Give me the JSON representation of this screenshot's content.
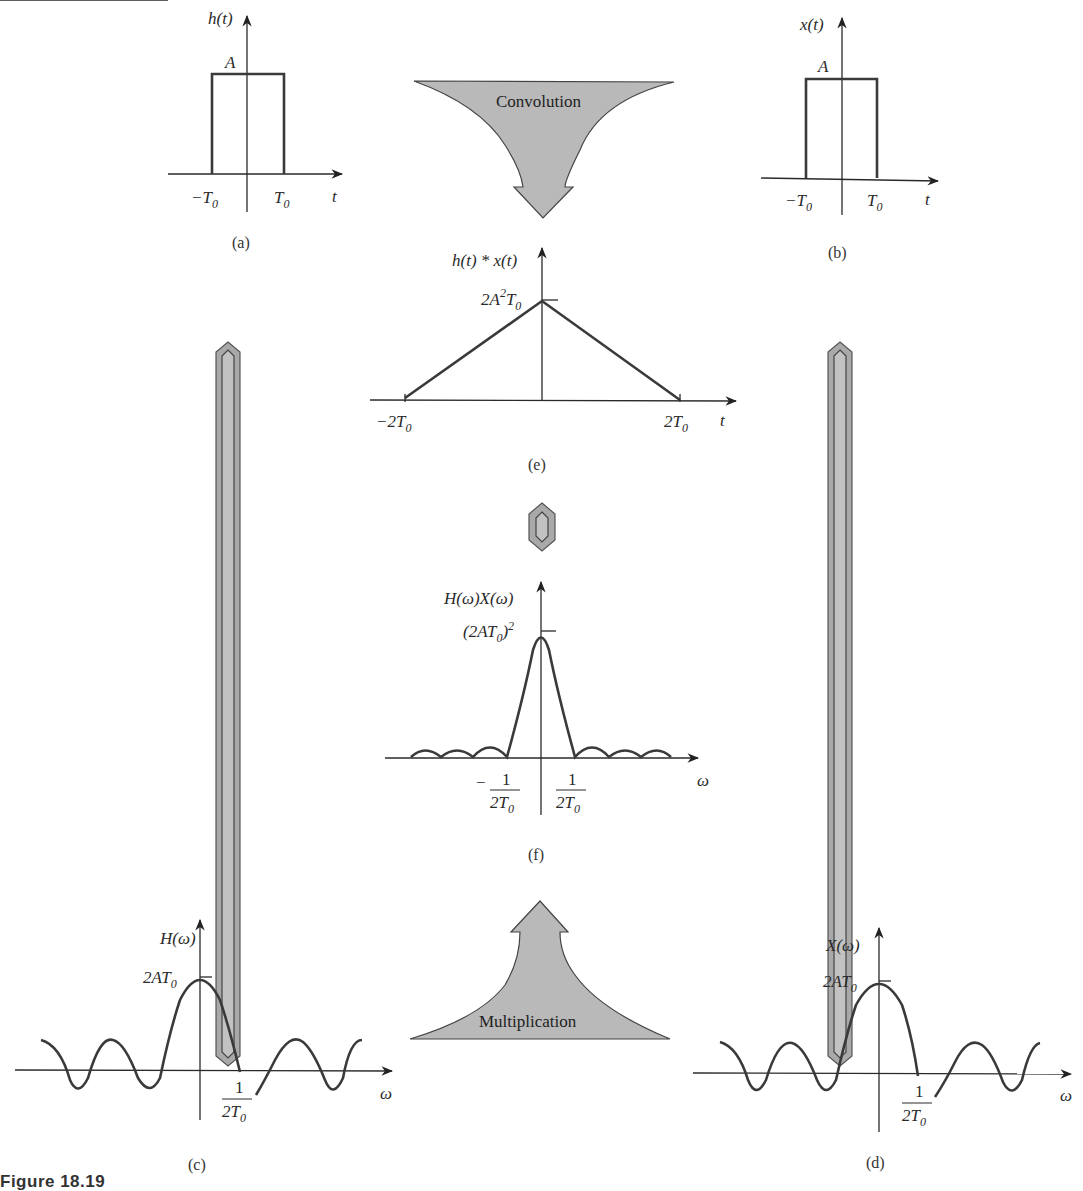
{
  "figure": {
    "caption": "Figure 18.19",
    "panels": {
      "a": {
        "label": "(a)",
        "ylabel": "h(t)",
        "xlabel": "t",
        "amplitude": "A",
        "ticks": [
          "−T",
          "T"
        ],
        "tick_sub": "0"
      },
      "b": {
        "label": "(b)",
        "ylabel": "x(t)",
        "xlabel": "t",
        "amplitude": "A",
        "ticks": [
          "−T",
          "T"
        ],
        "tick_sub": "0"
      },
      "e": {
        "label": "(e)",
        "ylabel": "h(t) * x(t)",
        "xlabel": "t",
        "peak_main": "2A",
        "peak_sup": "2",
        "peak_T": "T",
        "peak_sub": "0",
        "ticks": [
          "−2T",
          "2T"
        ],
        "tick_sub": "0"
      },
      "f": {
        "label": "(f)",
        "ylabel": "H(ω)X(ω)",
        "xlabel": "ω",
        "peak_main": "(2AT",
        "peak_sub": "0",
        "peak_close": ")",
        "peak_sup": "2",
        "tick_neg": "−",
        "tick_num": "1",
        "tick_den": "2T",
        "tick_sub": "0"
      },
      "c": {
        "label": "(c)",
        "ylabel": "H(ω)",
        "xlabel": "ω",
        "peak_main": "2AT",
        "peak_sub": "0",
        "tick_num": "1",
        "tick_den": "2T",
        "tick_sub": "0"
      },
      "d": {
        "label": "(d)",
        "ylabel": "X(ω)",
        "xlabel": "ω",
        "peak_main": "2AT",
        "peak_sub": "0",
        "tick_num": "1",
        "tick_den": "2T",
        "tick_sub": "0"
      }
    },
    "arrows": {
      "top": "Convolution",
      "bottom": "Multiplication"
    },
    "colors": {
      "arrow_fill": "#b9b9b9",
      "arrow_stroke": "#444444",
      "curve": "#3a3a3a"
    }
  }
}
